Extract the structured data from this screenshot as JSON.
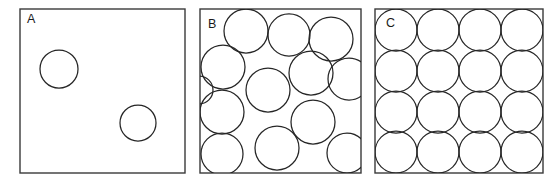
{
  "figure": {
    "background_color": "#ffffff",
    "width": 558,
    "height": 182,
    "box_stroke_color": "#3a3a3a",
    "circle_stroke_color": "#262626",
    "label_color": "#1a1a1a"
  },
  "panels": [
    {
      "label": "A",
      "label_position": {
        "x": 27,
        "y": 23
      },
      "box": {
        "x": 20,
        "y": 9,
        "width": 165,
        "height": 164
      },
      "circle_count": 2,
      "description": "dilute - two isolated circles",
      "circles": [
        {
          "cx": 59,
          "cy": 69,
          "r": 19
        },
        {
          "cx": 138,
          "cy": 123,
          "r": 18
        }
      ]
    },
    {
      "label": "B",
      "label_position": {
        "x": 208,
        "y": 28
      },
      "box": {
        "x": 200,
        "y": 9,
        "width": 161,
        "height": 164
      },
      "circle_count": 13,
      "description": "disordered dense packing - randomly arranged overlapping circles",
      "circles": [
        {
          "cx": 246,
          "cy": 31,
          "r": 22
        },
        {
          "cx": 289,
          "cy": 35,
          "r": 21
        },
        {
          "cx": 331,
          "cy": 39,
          "r": 22
        },
        {
          "cx": 223,
          "cy": 67,
          "r": 22
        },
        {
          "cx": 268,
          "cy": 90,
          "r": 22
        },
        {
          "cx": 311,
          "cy": 73,
          "r": 22
        },
        {
          "cx": 349,
          "cy": 79,
          "r": 21
        },
        {
          "cx": 222,
          "cy": 112,
          "r": 22
        },
        {
          "cx": 313,
          "cy": 122,
          "r": 22
        },
        {
          "cx": 222,
          "cy": 154,
          "r": 21
        },
        {
          "cx": 277,
          "cy": 148,
          "r": 22
        },
        {
          "cx": 347,
          "cy": 153,
          "r": 20
        },
        {
          "cx": 199,
          "cy": 90,
          "r": 14
        }
      ]
    },
    {
      "label": "C",
      "label_position": {
        "x": 386,
        "y": 27
      },
      "box": {
        "x": 375,
        "y": 9,
        "width": 168,
        "height": 164
      },
      "circle_count": 16,
      "description": "ordered crystalline packing - 4 by 4 square lattice of circles",
      "grid": {
        "rows": 4,
        "columns": 4,
        "spacing_x": 42,
        "spacing_y": 41,
        "origin": {
          "x": 396,
          "y": 30
        },
        "radius": 21
      },
      "circles": [
        {
          "cx": 396,
          "cy": 30,
          "r": 21
        },
        {
          "cx": 438,
          "cy": 30,
          "r": 21
        },
        {
          "cx": 480,
          "cy": 30,
          "r": 21
        },
        {
          "cx": 522,
          "cy": 30,
          "r": 21
        },
        {
          "cx": 396,
          "cy": 71,
          "r": 21
        },
        {
          "cx": 438,
          "cy": 71,
          "r": 21
        },
        {
          "cx": 480,
          "cy": 71,
          "r": 21
        },
        {
          "cx": 522,
          "cy": 71,
          "r": 21
        },
        {
          "cx": 396,
          "cy": 112,
          "r": 21
        },
        {
          "cx": 438,
          "cy": 112,
          "r": 21
        },
        {
          "cx": 480,
          "cy": 112,
          "r": 21
        },
        {
          "cx": 522,
          "cy": 112,
          "r": 21
        },
        {
          "cx": 396,
          "cy": 152,
          "r": 21
        },
        {
          "cx": 438,
          "cy": 152,
          "r": 21
        },
        {
          "cx": 480,
          "cy": 152,
          "r": 21
        },
        {
          "cx": 522,
          "cy": 152,
          "r": 21
        }
      ]
    }
  ]
}
